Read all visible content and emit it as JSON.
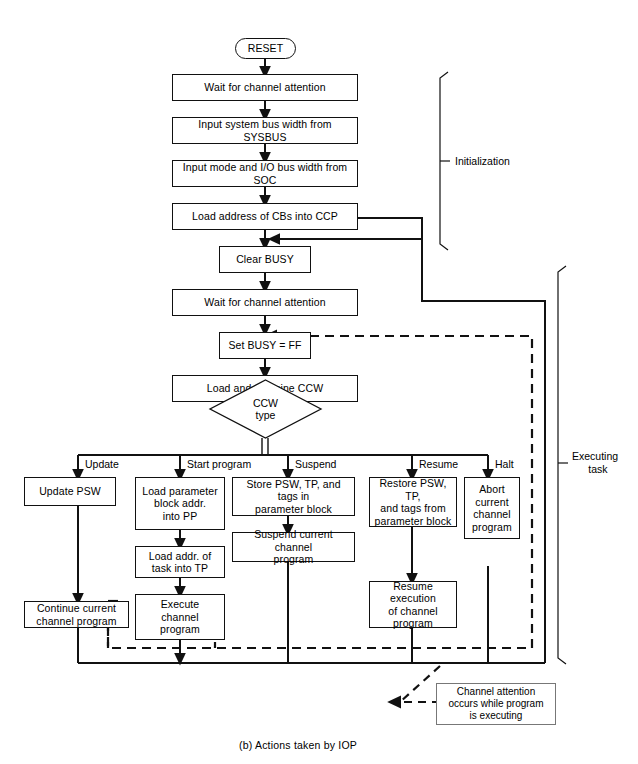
{
  "figure": {
    "caption": "(b)  Actions taken by IOP"
  },
  "brackets": [
    {
      "name": "initialization",
      "label": "Initialization"
    },
    {
      "name": "executing-task",
      "label": "Executing\ntask"
    }
  ],
  "bracket_labels": {
    "initialization": "Initialization",
    "executing_task_line1": "Executing",
    "executing_task_line2": "task"
  },
  "nodes": {
    "reset": "RESET",
    "wait_ca_1": "Wait for channel attention",
    "input_sysbus": "Input system bus width from SYSBUS",
    "input_soc": "Input mode and I/O bus width from SOC",
    "load_cbs": "Load address of CBs into CCP",
    "clear_busy": "Clear BUSY",
    "wait_ca_2": "Wait for channel attention",
    "set_busy": "Set BUSY = FF",
    "load_ccw": "Load and examine CCW",
    "ccw_type_l1": "CCW",
    "ccw_type_l2": "type",
    "update_psw": "Update PSW",
    "continue_prog_l1": "Continue current",
    "continue_prog_l2": "channel program",
    "load_param_l1": "Load parameter",
    "load_param_l2": "block addr.",
    "load_param_l3": "into PP",
    "load_task_l1": "Load addr. of",
    "load_task_l2": "task into TP",
    "execute_l1": "Execute",
    "execute_l2": "channel",
    "execute_l3": "program",
    "store_psw_l1": "Store PSW, TP, and tags in",
    "store_psw_l2": "parameter block",
    "suspend_prog_l1": "Suspend current channel",
    "suspend_prog_l2": "program",
    "restore_psw_l1": "Restore PSW, TP,",
    "restore_psw_l2": "and tags from",
    "restore_psw_l3": "parameter block",
    "resume_exec_l1": "Resume execution",
    "resume_exec_l2": "of channel",
    "resume_exec_l3": "program",
    "abort_l1": "Abort",
    "abort_l2": "current",
    "abort_l3": "channel",
    "abort_l4": "program"
  },
  "branch_labels": {
    "update": "Update",
    "start_program": "Start program",
    "suspend": "Suspend",
    "resume": "Resume",
    "halt": "Halt"
  },
  "note": {
    "line1": "Channel attention",
    "line2": "occurs while program",
    "line3": "is executing"
  },
  "colors": {
    "stroke": "#111111",
    "background": "#ffffff",
    "note_border": "#777777"
  }
}
